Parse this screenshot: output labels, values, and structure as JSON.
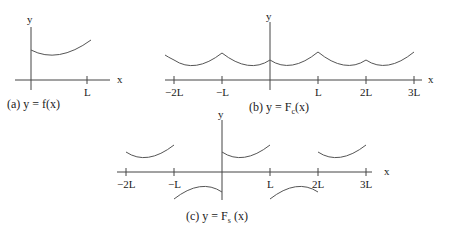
{
  "panels": [
    {
      "id": "a",
      "caption": "(a)  y = f(x)",
      "axis_labels": {
        "x": "x",
        "y": "y"
      },
      "ticks": [
        "L"
      ]
    },
    {
      "id": "b",
      "caption_prefix": "(b)  y = F",
      "caption_sub": "c",
      "caption_suffix": "(x)",
      "axis_labels": {
        "x": "x",
        "y": "y"
      },
      "ticks": [
        "−2L",
        "−L",
        "L",
        "2L",
        "3L"
      ]
    },
    {
      "id": "c",
      "caption_prefix": "(c)  y = F",
      "caption_sub": "s",
      "caption_suffix": " (x)",
      "axis_labels": {
        "x": "x",
        "y": "y"
      },
      "ticks": [
        "−2L",
        "−L",
        "L",
        "2L",
        "3L"
      ]
    }
  ]
}
